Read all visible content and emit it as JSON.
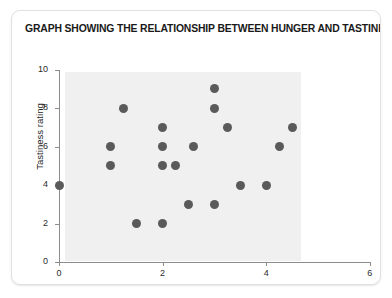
{
  "chart_data": {
    "type": "scatter",
    "title": "GRAPH SHOWING THE RELATIONSHIP BETWEEN HUNGER AND TASTINESS",
    "xlabel": "Number of hours since eating",
    "ylabel": "Tastiness rating",
    "xlim": [
      0,
      6
    ],
    "ylim": [
      0,
      10
    ],
    "xticks": [
      0,
      2,
      4,
      6
    ],
    "yticks": [
      0,
      2,
      4,
      6,
      8,
      10
    ],
    "xtick_labels": [
      "0",
      "2",
      "4",
      "6"
    ],
    "ytick_labels": [
      "0",
      "2",
      "4",
      "6",
      "8",
      "10"
    ],
    "grid": false,
    "legend": null,
    "marker_color": "#5a5a5a",
    "panel_color": "#f0f0f0",
    "points": [
      {
        "x": 0,
        "y": 4
      },
      {
        "x": 1,
        "y": 6
      },
      {
        "x": 1,
        "y": 5
      },
      {
        "x": 1.25,
        "y": 8
      },
      {
        "x": 1.5,
        "y": 2
      },
      {
        "x": 2,
        "y": 7
      },
      {
        "x": 2,
        "y": 6
      },
      {
        "x": 2,
        "y": 5
      },
      {
        "x": 2,
        "y": 2
      },
      {
        "x": 2.25,
        "y": 5
      },
      {
        "x": 2.6,
        "y": 6
      },
      {
        "x": 2.5,
        "y": 3
      },
      {
        "x": 3,
        "y": 9
      },
      {
        "x": 3,
        "y": 8
      },
      {
        "x": 3,
        "y": 3
      },
      {
        "x": 3.25,
        "y": 7
      },
      {
        "x": 3.5,
        "y": 4
      },
      {
        "x": 4,
        "y": 4
      },
      {
        "x": 4.25,
        "y": 6
      },
      {
        "x": 4.5,
        "y": 7
      }
    ]
  }
}
